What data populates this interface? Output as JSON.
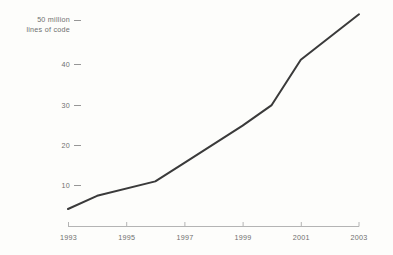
{
  "chart_data": {
    "type": "line",
    "title": "",
    "xlabel": "",
    "ylabel": "50 million lines of code",
    "ylabel_line1": "50 million",
    "ylabel_line2": "lines of code",
    "x": [
      1993,
      1994,
      1996,
      1997,
      1999,
      2000,
      2001,
      2003
    ],
    "values": [
      4.3,
      7.5,
      11.0,
      15.5,
      24.5,
      29.5,
      40.5,
      51.5
    ],
    "series": [
      {
        "name": "lines of code",
        "values": [
          4.3,
          7.5,
          11.0,
          15.5,
          24.5,
          29.5,
          40.5,
          51.5
        ]
      }
    ],
    "xlim": [
      1993,
      2003
    ],
    "ylim": [
      0,
      52
    ],
    "x_ticks": [
      1993,
      1995,
      1997,
      1999,
      2001,
      2003
    ],
    "x_tick_labels": [
      "1993",
      "1995",
      "1997",
      "1999",
      "2001",
      "2003"
    ],
    "y_ticks": [
      10,
      20,
      30,
      40,
      50
    ],
    "y_tick_labels": [
      "10",
      "20",
      "30",
      "40",
      "50 million"
    ],
    "grid": false,
    "legend": "none",
    "line_color": "#3a3a3a",
    "axis_color": "#b4b4b4",
    "text_color": "#6f6f6f",
    "background_color": "#fdfdfb",
    "tick_dash_glyph": "–"
  }
}
